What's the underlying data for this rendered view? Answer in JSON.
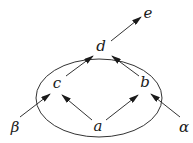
{
  "diagram": {
    "type": "directed-graph",
    "colors": {
      "stroke": "#333333",
      "text": "#1a1a1a",
      "background": "#ffffff"
    },
    "region": {
      "shape": "ellipse",
      "cx": 99,
      "cy": 98,
      "rx": 63,
      "ry": 39
    },
    "nodes": [
      {
        "id": "a",
        "label": "a",
        "x": 98,
        "y": 131
      },
      {
        "id": "b",
        "label": "b",
        "x": 145,
        "y": 87
      },
      {
        "id": "c",
        "label": "c",
        "x": 57,
        "y": 88
      },
      {
        "id": "d",
        "label": "d",
        "x": 101,
        "y": 51
      },
      {
        "id": "e",
        "label": "e",
        "x": 148,
        "y": 18
      },
      {
        "id": "beta",
        "label": "β",
        "x": 15,
        "y": 132
      },
      {
        "id": "alpha",
        "label": "α",
        "x": 184,
        "y": 132
      }
    ],
    "edges": [
      {
        "from": "a",
        "to": "c",
        "x1": 92,
        "y1": 120,
        "x2": 62,
        "y2": 95
      },
      {
        "from": "a",
        "to": "b",
        "x1": 106,
        "y1": 120,
        "x2": 138,
        "y2": 95
      },
      {
        "from": "c",
        "to": "d",
        "x1": 66,
        "y1": 76,
        "x2": 93,
        "y2": 56
      },
      {
        "from": "b",
        "to": "d",
        "x1": 139,
        "y1": 76,
        "x2": 112,
        "y2": 56
      },
      {
        "from": "d",
        "to": "e",
        "x1": 111,
        "y1": 41,
        "x2": 141,
        "y2": 17
      },
      {
        "from": "beta",
        "to": "c",
        "x1": 20,
        "y1": 117,
        "x2": 50,
        "y2": 94
      },
      {
        "from": "alpha",
        "to": "b",
        "x1": 180,
        "y1": 117,
        "x2": 151,
        "y2": 94
      }
    ]
  }
}
